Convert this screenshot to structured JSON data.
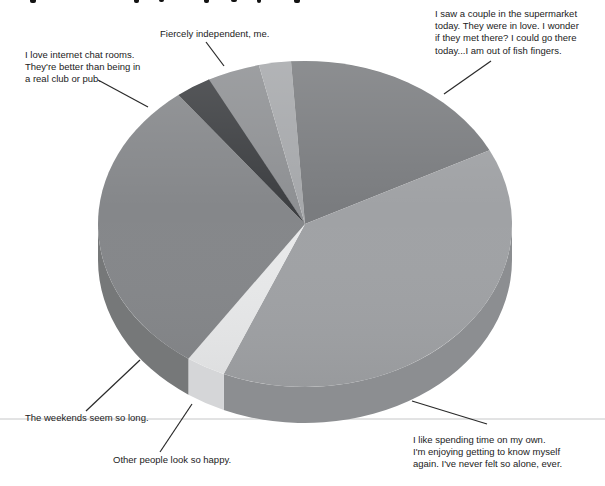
{
  "page": {
    "background": "#ffffff",
    "rule_line_color": "#c6c7c8",
    "leader_line_color": "#2a2a2a"
  },
  "chart_data": {
    "type": "pie",
    "style": "3d-ellipse",
    "title": "",
    "legend": "none",
    "start_angle_deg": -28,
    "slices": [
      {
        "name": "fiercely-independent",
        "label": "Fiercely independent, me.",
        "percent": 4.2,
        "color": "#8e9093",
        "side_color": "#7d7f82"
      },
      {
        "name": "unlabeled-sliver",
        "label": "",
        "percent": 2.5,
        "color": "#a6a8ab",
        "side_color": "#94969a"
      },
      {
        "name": "supermarket-couple",
        "label": "I saw a couple in the supermarket today. They were in love. I wonder if they met there? I could go there today...I am out of fish fingers.",
        "percent": 18.6,
        "color": "#7a7c7f",
        "side_color": "#6b6d70"
      },
      {
        "name": "spending-time-alone",
        "label": "I like spending time on my own. I'm enjoying getting to know myself again. I've never felt so alone, ever.",
        "percent": 38.9,
        "color": "#a0a2a5",
        "side_color": "#8c8e91"
      },
      {
        "name": "other-people-happy",
        "label": "Other people look so happy.",
        "percent": 3.1,
        "color": "#e8e9ea",
        "side_color": "#d5d6d8"
      },
      {
        "name": "weekends-long",
        "label": "The weekends seem so long.",
        "percent": 30.0,
        "color": "#85878a",
        "side_color": "#767879"
      },
      {
        "name": "internet-chat-rooms",
        "label": "I love internet chat rooms. They're better than being in a real club or pub.",
        "percent": 2.8,
        "color": "#3d3f42",
        "side_color": "#333538"
      }
    ]
  },
  "labels": {
    "fiercely": {
      "lines": [
        "Fiercely independent, me."
      ]
    },
    "supermarket": {
      "lines": [
        "I saw a couple in the supermarket",
        "today. They were in love. I wonder",
        "if they met there? I could go there",
        "today...I am out of fish fingers."
      ]
    },
    "chat": {
      "lines": [
        "I love internet chat rooms.",
        "They're better than being in",
        "a real club or pub."
      ]
    },
    "weekends": {
      "lines": [
        "The weekends seem so long."
      ]
    },
    "other": {
      "lines": [
        "Other people look so happy."
      ]
    },
    "spending": {
      "lines": [
        "I like spending time on my own.",
        "I'm enjoying getting to know myself",
        "again. I've never felt so alone, ever."
      ]
    }
  }
}
